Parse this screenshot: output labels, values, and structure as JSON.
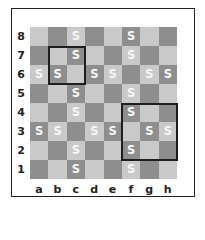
{
  "board": {
    "files": [
      "a",
      "b",
      "c",
      "d",
      "e",
      "f",
      "g",
      "h"
    ],
    "ranks": [
      "8",
      "7",
      "6",
      "5",
      "4",
      "3",
      "2",
      "1"
    ],
    "piece_symbol": "S",
    "colors": {
      "light": "#c9c9c9",
      "dark": "#8e8e8e",
      "piece": "#f7f7f7",
      "highlight": "#1e1e1e"
    },
    "pieces": [
      "c8",
      "f8",
      "c7",
      "f7",
      "a6",
      "b6",
      "d6",
      "e6",
      "g6",
      "h6",
      "c5",
      "f5",
      "c4",
      "f4",
      "a3",
      "b3",
      "d3",
      "e3",
      "g3",
      "h3",
      "c2",
      "f2",
      "c1",
      "f1"
    ],
    "highlights": [
      {
        "from": "b7",
        "to": "c6"
      },
      {
        "from": "f4",
        "to": "h2"
      }
    ]
  }
}
